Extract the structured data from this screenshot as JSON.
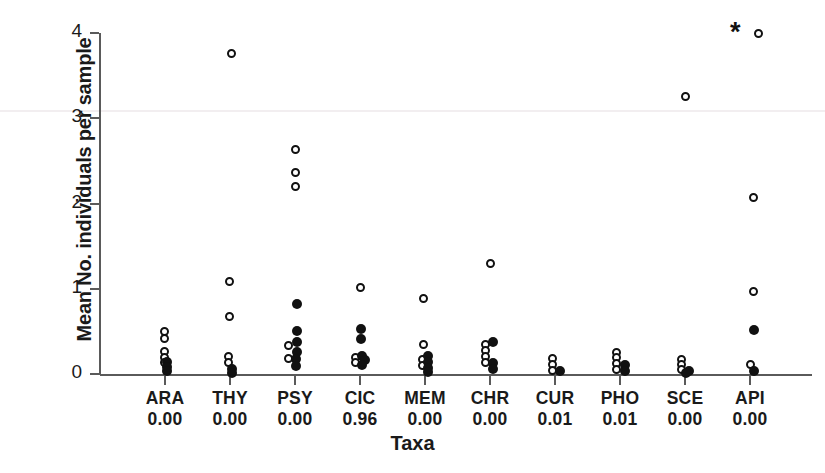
{
  "chart_data": {
    "type": "scatter",
    "title": "",
    "xlabel": "Taxa",
    "ylabel": "Mean No. individuals per sample",
    "ylim": [
      0,
      4.15
    ],
    "yticks": [
      0,
      1,
      2,
      3,
      4
    ],
    "ytick_labels": [
      "0",
      "1",
      "2",
      "3",
      "4"
    ],
    "grid": false,
    "legend": null,
    "annotations": [
      {
        "label": "*",
        "category": "API",
        "y": 4.05,
        "meaning": "significance-marker"
      }
    ],
    "categories": [
      "ARA",
      "THY",
      "PSY",
      "CIC",
      "MEM",
      "CHR",
      "CUR",
      "PHO",
      "SCE",
      "API"
    ],
    "category_pvalues": [
      "0.00",
      "0.00",
      "0.00",
      "0.96",
      "0.00",
      "0.00",
      "0.01",
      "0.01",
      "0.00",
      "0.00"
    ],
    "series": [
      {
        "name": "open-circle",
        "marker": "open circle",
        "color": "#111111",
        "points": [
          {
            "category": "ARA",
            "dx": -1,
            "y": 0.5
          },
          {
            "category": "ARA",
            "dx": -1,
            "y": 0.42
          },
          {
            "category": "ARA",
            "dx": -1,
            "y": 0.26
          },
          {
            "category": "ARA",
            "dx": -1,
            "y": 0.19
          },
          {
            "category": "ARA",
            "dx": -1,
            "y": 0.13
          },
          {
            "category": "THY",
            "dx": 1,
            "y": 3.76
          },
          {
            "category": "THY",
            "dx": -1,
            "y": 1.09
          },
          {
            "category": "THY",
            "dx": -1,
            "y": 0.68
          },
          {
            "category": "THY",
            "dx": -2,
            "y": 0.21
          },
          {
            "category": "THY",
            "dx": -2,
            "y": 0.13
          },
          {
            "category": "PSY",
            "dx": 0,
            "y": 2.63
          },
          {
            "category": "PSY",
            "dx": 0,
            "y": 2.36
          },
          {
            "category": "PSY",
            "dx": 0,
            "y": 2.2
          },
          {
            "category": "PSY",
            "dx": -7,
            "y": 0.33
          },
          {
            "category": "PSY",
            "dx": -7,
            "y": 0.18
          },
          {
            "category": "CIC",
            "dx": 0,
            "y": 1.02
          },
          {
            "category": "CIC",
            "dx": -5,
            "y": 0.19
          },
          {
            "category": "CIC",
            "dx": -5,
            "y": 0.13
          },
          {
            "category": "MEM",
            "dx": -2,
            "y": 0.88
          },
          {
            "category": "MEM",
            "dx": -2,
            "y": 0.35
          },
          {
            "category": "MEM",
            "dx": -3,
            "y": 0.17
          },
          {
            "category": "MEM",
            "dx": -3,
            "y": 0.1
          },
          {
            "category": "CHR",
            "dx": 0,
            "y": 1.3
          },
          {
            "category": "CHR",
            "dx": -5,
            "y": 0.35
          },
          {
            "category": "CHR",
            "dx": -5,
            "y": 0.27
          },
          {
            "category": "CHR",
            "dx": -5,
            "y": 0.2
          },
          {
            "category": "CHR",
            "dx": -5,
            "y": 0.13
          },
          {
            "category": "CUR",
            "dx": -3,
            "y": 0.18
          },
          {
            "category": "CUR",
            "dx": -3,
            "y": 0.11
          },
          {
            "category": "CUR",
            "dx": -3,
            "y": 0.04
          },
          {
            "category": "PHO",
            "dx": -4,
            "y": 0.25
          },
          {
            "category": "PHO",
            "dx": -4,
            "y": 0.19
          },
          {
            "category": "PHO",
            "dx": -4,
            "y": 0.12
          },
          {
            "category": "PHO",
            "dx": -4,
            "y": 0.05
          },
          {
            "category": "SCE",
            "dx": 0,
            "y": 3.26
          },
          {
            "category": "SCE",
            "dx": -4,
            "y": 0.17
          },
          {
            "category": "SCE",
            "dx": -4,
            "y": 0.11
          },
          {
            "category": "SCE",
            "dx": -4,
            "y": 0.05
          },
          {
            "category": "API",
            "dx": 8,
            "y": 4.0
          },
          {
            "category": "API",
            "dx": 3,
            "y": 2.07
          },
          {
            "category": "API",
            "dx": 3,
            "y": 0.97
          },
          {
            "category": "API",
            "dx": 0,
            "y": 0.11
          }
        ]
      },
      {
        "name": "filled-circle",
        "marker": "filled circle",
        "color": "#111111",
        "points": [
          {
            "category": "ARA",
            "dx": 2,
            "y": 0.14
          },
          {
            "category": "ARA",
            "dx": 2,
            "y": 0.08
          },
          {
            "category": "ARA",
            "dx": 2,
            "y": 0.03
          },
          {
            "category": "THY",
            "dx": 2,
            "y": 0.06
          },
          {
            "category": "THY",
            "dx": 2,
            "y": 0.01
          },
          {
            "category": "PSY",
            "dx": 2,
            "y": 0.82
          },
          {
            "category": "PSY",
            "dx": 2,
            "y": 0.5
          },
          {
            "category": "PSY",
            "dx": 2,
            "y": 0.37
          },
          {
            "category": "PSY",
            "dx": 2,
            "y": 0.26
          },
          {
            "category": "PSY",
            "dx": 1,
            "y": 0.18
          },
          {
            "category": "PSY",
            "dx": 1,
            "y": 0.09
          },
          {
            "category": "CIC",
            "dx": 1,
            "y": 0.53
          },
          {
            "category": "CIC",
            "dx": 1,
            "y": 0.41
          },
          {
            "category": "CIC",
            "dx": 2,
            "y": 0.21
          },
          {
            "category": "CIC",
            "dx": 5,
            "y": 0.17
          },
          {
            "category": "CIC",
            "dx": 2,
            "y": 0.11
          },
          {
            "category": "MEM",
            "dx": 3,
            "y": 0.21
          },
          {
            "category": "MEM",
            "dx": 3,
            "y": 0.14
          },
          {
            "category": "MEM",
            "dx": 3,
            "y": 0.07
          },
          {
            "category": "MEM",
            "dx": 3,
            "y": 0.02
          },
          {
            "category": "CHR",
            "dx": 3,
            "y": 0.38
          },
          {
            "category": "CHR",
            "dx": 3,
            "y": 0.13
          },
          {
            "category": "CHR",
            "dx": 3,
            "y": 0.06
          },
          {
            "category": "CUR",
            "dx": 5,
            "y": 0.04
          },
          {
            "category": "PHO",
            "dx": 5,
            "y": 0.1
          },
          {
            "category": "PHO",
            "dx": 5,
            "y": 0.04
          },
          {
            "category": "SCE",
            "dx": 4,
            "y": 0.04
          },
          {
            "category": "SCE",
            "dx": 1,
            "y": 0.01
          },
          {
            "category": "API",
            "dx": 4,
            "y": 0.52
          },
          {
            "category": "API",
            "dx": 4,
            "y": 0.04
          }
        ]
      }
    ]
  },
  "axes": {
    "ylabel": "Mean No. individuals per sample",
    "xlabel": "Taxa"
  }
}
